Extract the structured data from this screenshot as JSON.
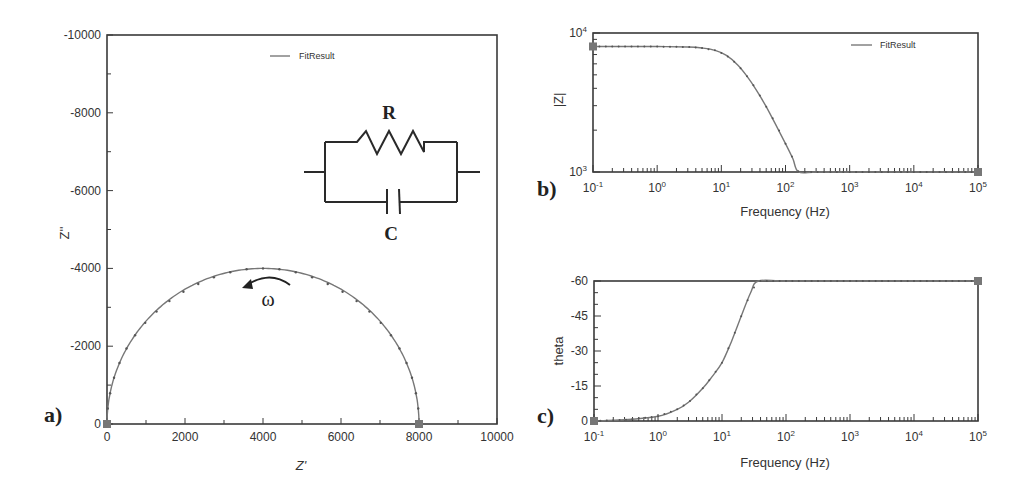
{
  "chart_data": [
    {
      "panel": "a)",
      "type": "scatter",
      "title": "",
      "xlabel": "Z'",
      "ylabel": "Z''",
      "xlim": [
        0,
        10000
      ],
      "ylim": [
        0,
        -10000
      ],
      "xticks": [
        "0",
        "2000",
        "4000",
        "6000",
        "8000",
        "10000"
      ],
      "yticks": [
        "0",
        "-2000",
        "-4000",
        "-6000",
        "-8000",
        "-10000"
      ],
      "legend": [
        "FitResult"
      ],
      "legend_position": "top-center",
      "grid": false,
      "annotations": [
        "R",
        "C",
        "ω"
      ],
      "inset": "Parallel RC equivalent circuit (resistor R in parallel with capacitor C)",
      "series": [
        {
          "name": "FitResult",
          "description": "Semicircle Nyquist plot centered at Z'=4000, radius 4000",
          "x": [
            0,
            20,
            80,
            180,
            320,
            500,
            720,
            980,
            1270,
            1600,
            1960,
            2340,
            2740,
            3160,
            3580,
            4000,
            4420,
            4840,
            5260,
            5660,
            6040,
            6400,
            6730,
            7020,
            7280,
            7500,
            7680,
            7820,
            7920,
            7980,
            8000
          ],
          "y": [
            0,
            -400,
            -790,
            -1190,
            -1570,
            -1940,
            -2280,
            -2600,
            -2890,
            -3160,
            -3400,
            -3600,
            -3770,
            -3900,
            -3980,
            -4000,
            -3980,
            -3900,
            -3770,
            -3600,
            -3400,
            -3160,
            -2890,
            -2600,
            -2280,
            -1940,
            -1570,
            -1190,
            -790,
            -400,
            0
          ]
        }
      ]
    },
    {
      "panel": "b)",
      "type": "line",
      "title": "",
      "xlabel": "Frequency (Hz)",
      "ylabel": "|Z|",
      "xscale": "log",
      "yscale": "log",
      "xlim": [
        0.1,
        100000
      ],
      "ylim": [
        1000,
        10000
      ],
      "xticks": [
        "10-1",
        "100",
        "101",
        "102",
        "103",
        "104",
        "105"
      ],
      "yticks": [
        "103",
        "104"
      ],
      "legend": [
        "FitResult"
      ],
      "legend_position": "top-right",
      "grid": false,
      "series": [
        {
          "name": "FitResult",
          "x": [
            0.1,
            0.3,
            1,
            3,
            5,
            8,
            12,
            18,
            25,
            35,
            50,
            70,
            100,
            130,
            160,
            300,
            1000,
            10000,
            100000
          ],
          "y": [
            8000,
            8000,
            7990,
            7930,
            7800,
            7500,
            6900,
            5900,
            4900,
            3900,
            2950,
            2200,
            1600,
            1250,
            1000,
            1000,
            1000,
            1000,
            1000
          ]
        }
      ]
    },
    {
      "panel": "c)",
      "type": "line",
      "title": "",
      "xlabel": "Frequency (Hz)",
      "ylabel": "theta",
      "xscale": "log",
      "xlim": [
        0.1,
        100000
      ],
      "ylim": [
        0,
        -60
      ],
      "xticks": [
        "10-1",
        "100",
        "101",
        "102",
        "103",
        "104",
        "105"
      ],
      "yticks": [
        "0",
        "-15",
        "-30",
        "-45",
        "-60"
      ],
      "grid": false,
      "series": [
        {
          "name": "FitResult",
          "x": [
            0.1,
            0.3,
            1,
            2,
            3,
            5,
            7,
            10,
            14,
            20,
            28,
            37,
            100,
            1000,
            10000,
            100000
          ],
          "y": [
            0,
            -0.5,
            -2,
            -5,
            -8,
            -14,
            -19,
            -25,
            -34,
            -45,
            -55,
            -60,
            -60,
            -60,
            -60,
            -60
          ]
        }
      ]
    }
  ],
  "labels": {
    "panel_a": "a)",
    "panel_b": "b)",
    "panel_c": "c)",
    "legend_a": "FitResult",
    "legend_b": "FitResult",
    "circuit_R": "R",
    "circuit_C": "C",
    "omega": "ω",
    "a_xlabel": "Z'",
    "a_ylabel": "Z''",
    "b_xlabel": "Frequency (Hz)",
    "b_ylabel": "|Z|",
    "c_xlabel": "Frequency (Hz)",
    "c_ylabel": "theta"
  }
}
